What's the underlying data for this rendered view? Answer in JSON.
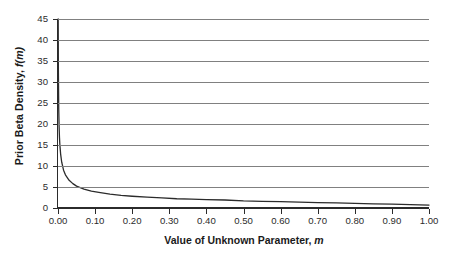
{
  "chart_data": {
    "type": "line",
    "title": "",
    "xlabel": "Value of Unknown Parameter, m",
    "xlabel_main": "Value of Unknown Parameter,",
    "xlabel_italic": "m",
    "ylabel": "Prior Beta Density, f(m)",
    "ylabel_main": "Prior Beta Density,",
    "ylabel_italic": "f(m)",
    "xlim": [
      0.0,
      1.0
    ],
    "ylim": [
      0,
      45
    ],
    "grid": "horizontal",
    "legend": "none",
    "x_ticks": [
      "0.00",
      "0.10",
      "0.20",
      "0.30",
      "0.40",
      "0.50",
      "0.60",
      "0.70",
      "0.80",
      "0.90",
      "1.00"
    ],
    "x_tick_values": [
      0.0,
      0.1,
      0.2,
      0.3,
      0.4,
      0.5,
      0.6,
      0.7,
      0.8,
      0.9,
      1.0
    ],
    "y_ticks": [
      "45",
      "40",
      "35",
      "30",
      "25",
      "20",
      "15",
      "10",
      "5",
      "0"
    ],
    "y_tick_values": [
      45,
      40,
      35,
      30,
      25,
      20,
      15,
      10,
      5,
      0
    ],
    "line_color": "#2b2b2b",
    "grid_color": "#808080",
    "axis_color": "#2b2b2b",
    "series": [
      {
        "name": "Prior Beta Density",
        "x": [
          0.0005,
          0.001,
          0.002,
          0.003,
          0.004,
          0.005,
          0.007,
          0.01,
          0.015,
          0.02,
          0.03,
          0.04,
          0.05,
          0.07,
          0.09,
          0.11,
          0.14,
          0.17,
          0.2,
          0.24,
          0.28,
          0.32,
          0.36,
          0.4,
          0.45,
          0.5,
          0.55,
          0.6,
          0.65,
          0.7,
          0.75,
          0.8,
          0.85,
          0.9,
          0.95,
          1.0
        ],
        "y": [
          45.0,
          33.0,
          23.5,
          19.3,
          16.8,
          15.1,
          12.9,
          10.9,
          9.0,
          7.9,
          6.6,
          5.8,
          5.2,
          4.5,
          4.0,
          3.7,
          3.3,
          3.0,
          2.8,
          2.6,
          2.4,
          2.2,
          2.1,
          2.0,
          1.9,
          1.7,
          1.6,
          1.5,
          1.4,
          1.3,
          1.2,
          1.1,
          1.0,
          0.9,
          0.8,
          0.7
        ]
      }
    ]
  }
}
